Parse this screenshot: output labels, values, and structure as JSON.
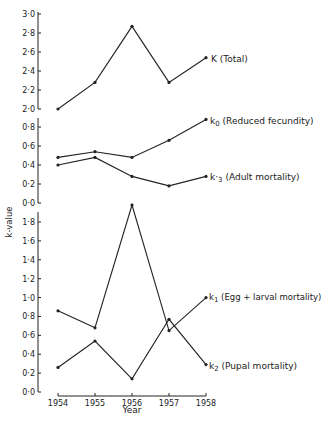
{
  "chart_data": [
    {
      "type": "line",
      "panel": "top",
      "ylabel": "k-value",
      "ylim": [
        2.0,
        3.0
      ],
      "yticks": [
        "2·0",
        "2·2",
        "2·4",
        "2·6",
        "2·8",
        "3·0"
      ],
      "x": [
        1954,
        1955,
        1956,
        1957,
        1958
      ],
      "series": [
        {
          "name": "K (Total)",
          "values": [
            2.0,
            2.28,
            2.87,
            2.28,
            2.54
          ]
        }
      ]
    },
    {
      "type": "line",
      "panel": "middle",
      "ylim": [
        0.0,
        0.9
      ],
      "yticks": [
        "0·0",
        "0·2",
        "0·4",
        "0·6",
        "0·8"
      ],
      "x": [
        1954,
        1955,
        1956,
        1957,
        1958
      ],
      "series": [
        {
          "name": "k0 (Reduced fecundity)",
          "values": [
            0.48,
            0.54,
            0.48,
            0.66,
            0.88
          ]
        },
        {
          "name": "k3 (Adult mortality)",
          "values": [
            0.4,
            0.48,
            0.28,
            0.18,
            0.28
          ]
        }
      ]
    },
    {
      "type": "line",
      "panel": "bottom",
      "ylim": [
        0.0,
        2.0
      ],
      "yticks": [
        "0·0",
        "0·2",
        "0·4",
        "0·6",
        "0·8",
        "1·0",
        "1·2",
        "1·4",
        "1·6",
        "1·8"
      ],
      "x": [
        1954,
        1955,
        1956,
        1957,
        1958
      ],
      "xlabel": "Year",
      "xticks": [
        "1954",
        "1955",
        "1956",
        "1957",
        "1958"
      ],
      "series": [
        {
          "name": "k1 (Egg + larval mortality)",
          "values": [
            0.86,
            0.68,
            1.98,
            0.65,
            1.0
          ]
        },
        {
          "name": "k2 (Pupal mortality)",
          "values": [
            0.26,
            0.54,
            0.14,
            0.77,
            0.29
          ]
        }
      ]
    }
  ],
  "labels": {
    "ylabel": "k-value",
    "xlabel": "Year",
    "K": {
      "main": "K",
      "rest": " (Total)"
    },
    "k0": {
      "main": "k",
      "sub": "0",
      "rest": " (Reduced fecundity)"
    },
    "k3": {
      "main": "k·",
      "sub": "3",
      "rest": " (Adult mortality)"
    },
    "k1": {
      "main": "k",
      "sub": "1",
      "rest": " (Egg + larval mortality)"
    },
    "k2": {
      "main": "k",
      "sub": "2",
      "rest": " (Pupal mortality)"
    }
  },
  "colors": {
    "line": "#222222",
    "background": "#ffffff"
  }
}
